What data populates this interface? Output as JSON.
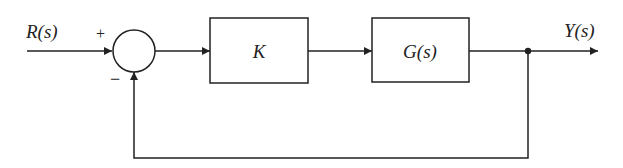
{
  "diagram": {
    "type": "negative feedback control loop block diagram",
    "input_label": "R(s)",
    "output_label": "Y(s)",
    "summing_junction": {
      "plus_sign": "+",
      "minus_sign": "−"
    },
    "blocks": [
      {
        "id": "controller",
        "label": "K"
      },
      {
        "id": "plant",
        "label": "G(s)"
      }
    ],
    "colors": {
      "line": "#222222",
      "background": "#ffffff"
    }
  }
}
